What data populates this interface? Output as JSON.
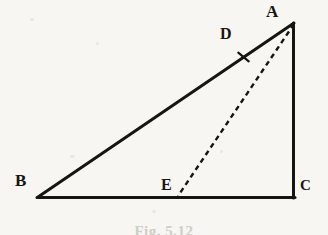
{
  "figure": {
    "type": "geometry-diagram",
    "shape": "right-triangle-with-cevian",
    "background_color": "#f7f6f3",
    "ink_color": "#17150f",
    "caption": "Fig. 5.12",
    "caption_color": "#cfcdc8",
    "vertices": [
      {
        "id": "A",
        "label": "A",
        "x": 294,
        "y": 23,
        "label_x": 266,
        "label_y": 3
      },
      {
        "id": "B",
        "label": "B",
        "x": 38,
        "y": 197,
        "label_x": 15,
        "label_y": 172
      },
      {
        "id": "C",
        "label": "C",
        "x": 294,
        "y": 197,
        "label_x": 300,
        "label_y": 178
      },
      {
        "id": "D",
        "label": "D",
        "x": 243,
        "y": 57,
        "label_x": 220,
        "label_y": 26
      },
      {
        "id": "E",
        "label": "E",
        "x": 178,
        "y": 196,
        "label_x": 161,
        "label_y": 177
      }
    ],
    "segments": [
      {
        "id": "AB",
        "from": "A",
        "to": "B",
        "style": "solid",
        "width": 3.0,
        "name": "hypotenuse-ab"
      },
      {
        "id": "BC",
        "from": "B",
        "to": "C",
        "style": "solid",
        "width": 3.0,
        "name": "base-bc"
      },
      {
        "id": "AC",
        "from": "A",
        "to": "C",
        "style": "solid",
        "width": 3.0,
        "name": "vertical-leg-ac"
      },
      {
        "id": "AE",
        "from": "A",
        "to": "E",
        "style": "dashed",
        "width": 2.4,
        "name": "cevian-ae",
        "dash": "5 4"
      }
    ],
    "tick_marks": [
      {
        "on_segment": "AB",
        "at_point": "D",
        "x": 243,
        "y": 57,
        "name": "congruence-tick-d"
      }
    ]
  }
}
